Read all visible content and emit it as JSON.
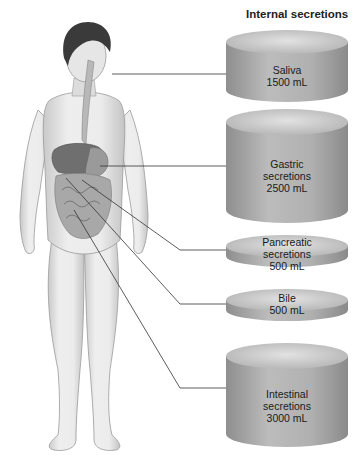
{
  "title": "Internal secretions",
  "secretions": [
    {
      "name_line1": "Saliva",
      "name_line2": "",
      "volume": "1500 mL"
    },
    {
      "name_line1": "Gastric",
      "name_line2": "secretions",
      "volume": "2500 mL"
    },
    {
      "name_line1": "Pancreatic",
      "name_line2": "secretions",
      "volume": "500 mL"
    },
    {
      "name_line1": "Bile",
      "name_line2": "",
      "volume": "500 mL"
    },
    {
      "name_line1": "Intestinal",
      "name_line2": "secretions",
      "volume": "3000 mL"
    }
  ],
  "colors": {
    "cylinder_side": "#a9a9a9",
    "cylinder_top": "#cfcfcf",
    "leader_line": "#333333",
    "skin": "#e4e4e4"
  }
}
